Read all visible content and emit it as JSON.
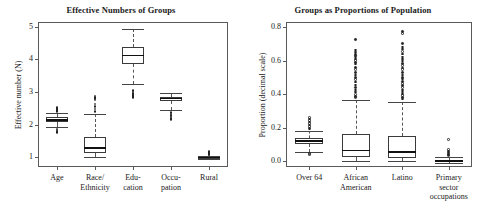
{
  "figure": {
    "width": 484,
    "height": 219,
    "background": "#ffffff",
    "line_color": "#5a5a5a"
  },
  "chart_data": [
    {
      "type": "box",
      "panel": "left",
      "title": "Effective Numbers of Groups",
      "xlabel": "",
      "ylabel": "Effective number (N)",
      "ylim": [
        0.7,
        5.15
      ],
      "yticks": [
        1,
        2,
        3,
        4,
        5
      ],
      "ytick_labels": [
        "1",
        "2",
        "3",
        "4",
        "5"
      ],
      "grid": false,
      "legend": "none",
      "categories": [
        "Age",
        "Race/\nEthnicity",
        "Edu-\ncation",
        "Occu-\npation",
        "Rural"
      ],
      "boxes": [
        {
          "label": "Age",
          "whisker_low": 1.93,
          "q1": 2.08,
          "median": 2.15,
          "q3": 2.22,
          "whisker_high": 2.37,
          "outliers": [
            2.52,
            2.49,
            2.46,
            2.43,
            2.4,
            1.86,
            1.83,
            1.79,
            1.76
          ]
        },
        {
          "label": "Race/Ethnicity",
          "whisker_low": 1.02,
          "q1": 1.14,
          "median": 1.28,
          "q3": 1.62,
          "whisker_high": 2.33,
          "outliers": [
            2.88,
            2.84,
            2.8,
            2.76,
            2.63,
            2.56,
            2.48,
            2.41
          ]
        },
        {
          "label": "Education",
          "whisker_low": 3.25,
          "q1": 3.86,
          "median": 4.12,
          "q3": 4.38,
          "whisker_high": 4.95,
          "outliers": [
            3.04,
            3.0,
            2.96,
            2.93,
            2.9,
            2.87,
            2.84
          ]
        },
        {
          "label": "Occupation",
          "whisker_low": 2.44,
          "q1": 2.73,
          "median": 2.8,
          "q3": 2.86,
          "whisker_high": 2.97,
          "outliers": [
            2.38,
            2.33,
            2.28,
            2.24,
            2.19,
            2.15
          ]
        },
        {
          "label": "Rural",
          "whisker_low": 0.96,
          "q1": 0.97,
          "median": 0.99,
          "q3": 1.01,
          "whisker_high": 1.04,
          "outliers": [
            1.18,
            1.14,
            1.11,
            1.09,
            1.07
          ]
        }
      ]
    },
    {
      "type": "box",
      "panel": "right",
      "title": "Groups as Proportions of Population",
      "xlabel": "",
      "ylabel": "Proportion (decimal scale)",
      "ylim": [
        -0.035,
        0.83
      ],
      "yticks": [
        0.0,
        0.2,
        0.4,
        0.6,
        0.8
      ],
      "ytick_labels": [
        "0.0",
        "0.2",
        "0.4",
        "0.6",
        "0.8"
      ],
      "grid": false,
      "legend": "none",
      "categories": [
        "Over 64",
        "African\nAmerican",
        "Latino",
        "Primary\nsector\noccupations"
      ],
      "boxes": [
        {
          "label": "Over 64",
          "whisker_low": 0.053,
          "q1": 0.104,
          "median": 0.122,
          "q3": 0.136,
          "whisker_high": 0.182,
          "outliers": [
            0.262,
            0.252,
            0.243,
            0.234,
            0.224,
            0.215,
            0.206,
            0.198,
            0.192,
            0.046,
            0.04
          ]
        },
        {
          "label": "African American",
          "whisker_low": 0.0,
          "q1": 0.024,
          "median": 0.063,
          "q3": 0.163,
          "whisker_high": 0.363,
          "outliers": [
            0.724,
            0.664,
            0.65,
            0.64,
            0.63,
            0.62,
            0.61,
            0.6,
            0.59,
            0.58,
            0.56,
            0.545,
            0.53,
            0.515,
            0.5,
            0.487,
            0.472,
            0.455,
            0.44,
            0.425,
            0.412,
            0.398,
            0.385,
            0.378
          ]
        },
        {
          "label": "Latino",
          "whisker_low": 0.0,
          "q1": 0.02,
          "median": 0.053,
          "q3": 0.152,
          "whisker_high": 0.352,
          "outliers": [
            0.772,
            0.762,
            0.7,
            0.68,
            0.668,
            0.655,
            0.64,
            0.622,
            0.61,
            0.598,
            0.583,
            0.57,
            0.556,
            0.545,
            0.53,
            0.515,
            0.5,
            0.49,
            0.476,
            0.462,
            0.45,
            0.438,
            0.425,
            0.412,
            0.4,
            0.39,
            0.38,
            0.37
          ]
        },
        {
          "label": "Primary sector occupations",
          "whisker_low": -0.012,
          "q1": -0.006,
          "median": 0.0,
          "q3": 0.008,
          "whisker_high": 0.022,
          "outliers": [
            0.128,
            0.068,
            0.06,
            0.054,
            0.048,
            0.042,
            0.037,
            0.032
          ]
        }
      ]
    }
  ]
}
